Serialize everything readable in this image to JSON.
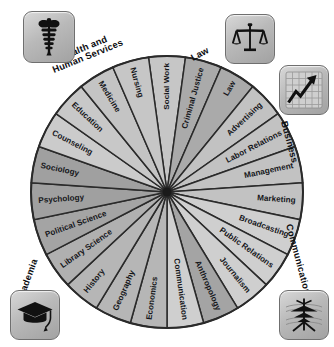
{
  "figure": {
    "background_color": "#ffffff",
    "center": {
      "x": 167,
      "y": 192
    },
    "radius": 136
  },
  "chart_data": {
    "type": "pie",
    "xlabel": "",
    "ylabel": "",
    "legend_position": "corners",
    "grid": false,
    "note": "23 equal wedges of 15.652 degrees each, radiating from a dark center point; shading encodes the five category groups.",
    "categories": [
      "Social Work",
      "Criminal Justice",
      "Law",
      "Advertising",
      "Labor Relations",
      "Management",
      "Marketing",
      "Broadcasting",
      "Public Relations",
      "Journalism",
      "Anthropology",
      "Communication",
      "Economics",
      "Geography",
      "History",
      "Library Science",
      "Political Science",
      "Psychology",
      "Sociology",
      "Counseling",
      "Education",
      "Medicine",
      "Nursing"
    ],
    "values": [
      1,
      1,
      1,
      1,
      1,
      1,
      1,
      1,
      1,
      1,
      1,
      1,
      1,
      1,
      1,
      1,
      1,
      1,
      1,
      1,
      1,
      1,
      1
    ],
    "slice_groups": [
      "Health and Human Services",
      "Law",
      "Law",
      "Business",
      "Business",
      "Business",
      "Business",
      "Communication",
      "Communication",
      "Communication",
      "Academia",
      "Communication",
      "Academia",
      "Academia",
      "Academia",
      "Academia",
      "Academia",
      "Academia",
      "Academia",
      "Health and Human Services",
      "Health and Human Services",
      "Health and Human Services",
      "Health and Human Services"
    ],
    "slice_colors": [
      "#c6c6c6",
      "#aaaaaa",
      "#aaaaaa",
      "#c2c2c2",
      "#c2c2c2",
      "#c2c2c2",
      "#c2c2c2",
      "#cfcfcf",
      "#cfcfcf",
      "#cfcfcf",
      "#a4a4a4",
      "#cfcfcf",
      "#b6b6b6",
      "#b6b6b6",
      "#b6b6b6",
      "#b0b0b0",
      "#a4a4a4",
      "#a0a0a0",
      "#a0a0a0",
      "#cbcbcb",
      "#c8c8c8",
      "#c4c4c4",
      "#c6c6c6"
    ]
  },
  "wheel": {
    "outline_color": "#2a2a2a",
    "divider_color": "#2a2a2a",
    "center_dot_color": "#1a1a1a",
    "slices": [
      {
        "label": "Social Work",
        "index": 0,
        "group": "Health and Human Services",
        "color": "#c6c6c6"
      },
      {
        "label": "Criminal Justice",
        "index": 1,
        "group": "Law",
        "color": "#aaaaaa"
      },
      {
        "label": "Law",
        "index": 2,
        "group": "Law",
        "color": "#aaaaaa"
      },
      {
        "label": "Advertising",
        "index": 3,
        "group": "Business",
        "color": "#c2c2c2"
      },
      {
        "label": "Labor Relations",
        "index": 4,
        "group": "Business",
        "color": "#c2c2c2"
      },
      {
        "label": "Management",
        "index": 5,
        "group": "Business",
        "color": "#c2c2c2"
      },
      {
        "label": "Marketing",
        "index": 6,
        "group": "Business",
        "color": "#c2c2c2"
      },
      {
        "label": "Broadcasting",
        "index": 7,
        "group": "Communication",
        "color": "#cfcfcf"
      },
      {
        "label": "Public Relations",
        "index": 8,
        "group": "Communication",
        "color": "#cfcfcf"
      },
      {
        "label": "Journalism",
        "index": 9,
        "group": "Communication",
        "color": "#cfcfcf"
      },
      {
        "label": "Anthropology",
        "index": 10,
        "group": "Academia",
        "color": "#a4a4a4"
      },
      {
        "label": "Communication",
        "index": 11,
        "group": "Communication",
        "color": "#cfcfcf"
      },
      {
        "label": "Economics",
        "index": 12,
        "group": "Academia",
        "color": "#b6b6b6"
      },
      {
        "label": "Geography",
        "index": 13,
        "group": "Academia",
        "color": "#b6b6b6"
      },
      {
        "label": "History",
        "index": 14,
        "group": "Academia",
        "color": "#b6b6b6"
      },
      {
        "label": "Library Science",
        "index": 15,
        "group": "Academia",
        "color": "#b0b0b0"
      },
      {
        "label": "Political Science",
        "index": 16,
        "group": "Academia",
        "color": "#a4a4a4"
      },
      {
        "label": "Psychology",
        "index": 17,
        "group": "Academia",
        "color": "#a0a0a0"
      },
      {
        "label": "Sociology",
        "index": 18,
        "group": "Academia",
        "color": "#a0a0a0"
      },
      {
        "label": "Counseling",
        "index": 19,
        "group": "Health and Human Services",
        "color": "#cbcbcb"
      },
      {
        "label": "Education",
        "index": 20,
        "group": "Health and Human Services",
        "color": "#c8c8c8"
      },
      {
        "label": "Medicine",
        "index": 21,
        "group": "Health and Human Services",
        "color": "#c4c4c4"
      },
      {
        "label": "Nursing",
        "index": 22,
        "group": "Health and Human Services",
        "color": "#c6c6c6"
      }
    ]
  },
  "categories": [
    {
      "id": "health",
      "label_line1": "Health and",
      "label_line2": "Human Services",
      "label": "Health and Human Services",
      "icon": "caduceus-icon",
      "corner": "top-left"
    },
    {
      "id": "law",
      "label_line1": "Law",
      "label_line2": "",
      "label": "Law",
      "icon": "scales-icon",
      "corner": "top-right"
    },
    {
      "id": "business",
      "label_line1": "Business",
      "label_line2": "",
      "label": "Business",
      "icon": "growth-chart-icon",
      "corner": "right"
    },
    {
      "id": "communication",
      "label_line1": "Communication",
      "label_line2": "",
      "label": "Communication",
      "icon": "radio-tower-icon",
      "corner": "bottom-right"
    },
    {
      "id": "academia",
      "label_line1": "Academia",
      "label_line2": "",
      "label": "Academia",
      "icon": "graduation-cap-icon",
      "corner": "bottom-left"
    }
  ]
}
